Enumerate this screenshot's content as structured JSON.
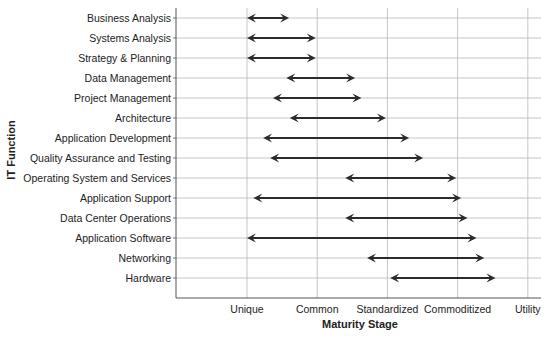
{
  "chart_data": {
    "type": "range-arrow",
    "title": "",
    "xlabel": "Maturity Stage",
    "ylabel": "IT Function",
    "x_ticks": [
      {
        "value": 1,
        "label": "Unique"
      },
      {
        "value": 2,
        "label": "Common"
      },
      {
        "value": 3,
        "label": "Standardized"
      },
      {
        "value": 4,
        "label": "Commoditized"
      },
      {
        "value": 5,
        "label": "Utility"
      }
    ],
    "xlim": [
      0,
      5.1
    ],
    "grid": true,
    "categories": [
      "Business Analysis",
      "Systems Analysis",
      "Strategy & Planning",
      "Data Management",
      "Project Management",
      "Architecture",
      "Application Development",
      "Quality Assurance and Testing",
      "Operating System and Services",
      "Application Support",
      "Data Center Operations",
      "Application Software",
      "Networking",
      "Hardware"
    ],
    "ranges": [
      {
        "start": 1.0,
        "end": 1.6
      },
      {
        "start": 1.0,
        "end": 1.98
      },
      {
        "start": 1.0,
        "end": 1.98
      },
      {
        "start": 1.56,
        "end": 2.54
      },
      {
        "start": 1.37,
        "end": 2.63
      },
      {
        "start": 1.61,
        "end": 2.98
      },
      {
        "start": 1.23,
        "end": 3.31
      },
      {
        "start": 1.33,
        "end": 3.51
      },
      {
        "start": 2.4,
        "end": 3.98
      },
      {
        "start": 1.09,
        "end": 4.05
      },
      {
        "start": 2.4,
        "end": 4.14
      },
      {
        "start": 1.0,
        "end": 4.27
      },
      {
        "start": 2.71,
        "end": 4.38
      },
      {
        "start": 3.04,
        "end": 4.54
      }
    ],
    "colors": {
      "arrow": "#2b2b2b",
      "grid": "#b8b8b8",
      "axis": "#555555"
    }
  }
}
